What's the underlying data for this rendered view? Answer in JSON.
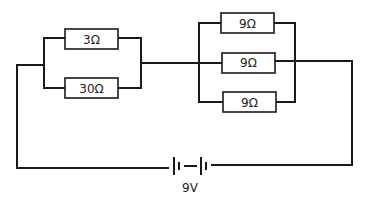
{
  "diagram": {
    "type": "circuit",
    "colors": {
      "wire": "#1a1a1a",
      "background": "#ffffff",
      "text": "#222222"
    },
    "group_left": {
      "arrangement": "parallel",
      "resistors": [
        {
          "label": "3Ω",
          "value_ohms": 3
        },
        {
          "label": "30Ω",
          "value_ohms": 30
        }
      ]
    },
    "group_right": {
      "arrangement": "parallel",
      "resistors": [
        {
          "label": "9Ω",
          "value_ohms": 9
        },
        {
          "label": "9Ω",
          "value_ohms": 9
        },
        {
          "label": "9Ω",
          "value_ohms": 9
        }
      ]
    },
    "battery": {
      "label": "9V",
      "voltage": 9,
      "cells": 2
    }
  }
}
